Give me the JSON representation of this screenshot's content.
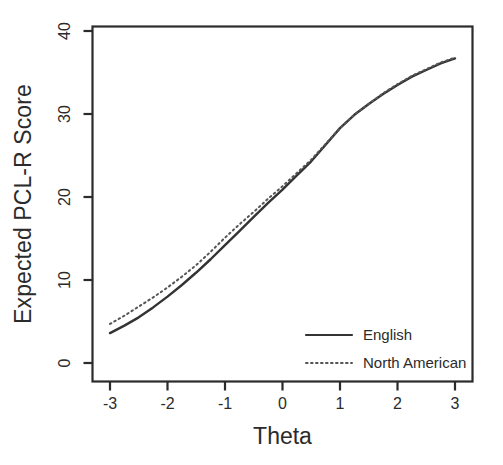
{
  "chart_data": {
    "type": "line",
    "title": "",
    "xlabel": "Theta",
    "ylabel": "Expected PCL-R Score",
    "xlim": [
      -3,
      3
    ],
    "ylim": [
      0,
      40
    ],
    "xticks": [
      "-3",
      "-2",
      "-1",
      "0",
      "1",
      "2",
      "3"
    ],
    "xtick_values": [
      -3,
      -2,
      -1,
      0,
      1,
      2,
      3
    ],
    "yticks": [
      "0",
      "10",
      "20",
      "30",
      "40"
    ],
    "ytick_values": [
      0,
      10,
      20,
      30,
      40
    ],
    "grid": false,
    "legend_position": "bottom-right",
    "x": [
      -3,
      -2.75,
      -2.5,
      -2.25,
      -2,
      -1.75,
      -1.5,
      -1.25,
      -1,
      -0.75,
      -0.5,
      -0.25,
      0,
      0.25,
      0.5,
      0.75,
      1,
      1.25,
      1.5,
      1.75,
      2,
      2.25,
      2.5,
      2.75,
      3
    ],
    "series": [
      {
        "name": "English",
        "style": "solid",
        "color": "#333333",
        "values": [
          3.6,
          4.5,
          5.5,
          6.7,
          8.0,
          9.4,
          10.9,
          12.5,
          14.2,
          15.9,
          17.6,
          19.3,
          20.9,
          22.6,
          24.3,
          26.3,
          28.3,
          29.9,
          31.2,
          32.4,
          33.5,
          34.5,
          35.3,
          36.1,
          36.7
        ]
      },
      {
        "name": "North American",
        "style": "dotted",
        "color": "#555555",
        "values": [
          4.7,
          5.7,
          6.8,
          7.9,
          9.1,
          10.4,
          11.8,
          13.4,
          15.1,
          16.7,
          18.2,
          19.8,
          21.3,
          22.9,
          24.5,
          26.4,
          28.3,
          29.9,
          31.2,
          32.5,
          33.6,
          34.6,
          35.4,
          36.2,
          36.8
        ]
      }
    ]
  },
  "legend": {
    "entries": [
      {
        "label": "English",
        "style": "solid"
      },
      {
        "label": "North American",
        "style": "dotted"
      }
    ]
  },
  "axes": {
    "x_title": "Theta",
    "y_title": "Expected PCL-R Score"
  },
  "colors": {
    "background": "#ffffff",
    "axis": "#2b2b2b",
    "english_line": "#333333",
    "north_american_line": "#555555"
  }
}
